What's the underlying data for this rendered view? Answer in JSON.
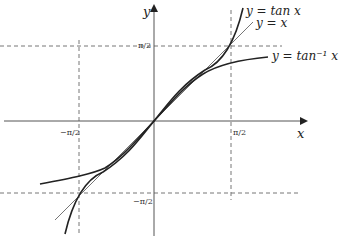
{
  "diagram": {
    "axes": {
      "x_label": "x",
      "y_label": "y"
    },
    "ticks": {
      "x_neg": "−π/2",
      "x_pos": "π/2",
      "y_pos": "π/2",
      "y_neg": "−π/2"
    },
    "curves": [
      {
        "name": "tan",
        "label": "y = tan x"
      },
      {
        "name": "identity",
        "label": "y = x"
      },
      {
        "name": "arctan",
        "label": "y = tan⁻¹ x"
      }
    ],
    "colors": {
      "axis": "#555555",
      "curve": "#222222",
      "line": "#666666",
      "dashed": "#777777"
    },
    "geometry": {
      "origin_x": 154,
      "origin_y": 121,
      "scale": 48.4
    }
  }
}
